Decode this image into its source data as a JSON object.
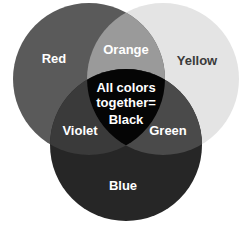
{
  "diagram": {
    "type": "venn",
    "title": "",
    "circles": [
      {
        "name": "Red",
        "fill": "#5a5a5a",
        "cx": 89,
        "cy": 79,
        "r": 76
      },
      {
        "name": "Yellow",
        "fill": "#e4e4e4",
        "cx": 163,
        "cy": 79,
        "r": 76
      },
      {
        "name": "Blue",
        "fill": "#262626",
        "cx": 126,
        "cy": 145,
        "r": 76
      }
    ],
    "regions": {
      "red": {
        "label": "Red",
        "color": "#ffffff"
      },
      "yellow": {
        "label": "Yellow",
        "color": "#3a3a3a"
      },
      "blue": {
        "label": "Blue",
        "color": "#ffffff"
      },
      "orange": {
        "label": "Orange",
        "fill": "#9a9a9a",
        "color": "#ffffff"
      },
      "violet": {
        "label": "Violet",
        "fill": "#3a3a3a",
        "color": "#ffffff"
      },
      "green": {
        "label": "Green",
        "fill": "#4a4a4a",
        "color": "#ffffff"
      },
      "black": {
        "label_line1": "All colors",
        "label_line2": "together=",
        "label_line3": "Black",
        "fill": "#050505",
        "color": "#ffffff"
      }
    }
  }
}
